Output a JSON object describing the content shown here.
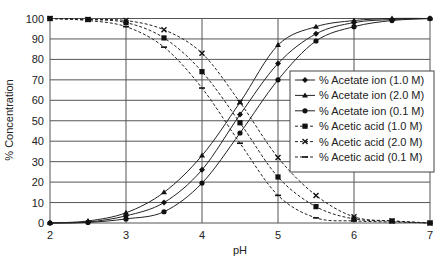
{
  "chart_data": {
    "type": "line",
    "title": "",
    "xlabel": "pH",
    "ylabel": "% Concentration",
    "xlim": [
      2,
      7
    ],
    "ylim": [
      0,
      100
    ],
    "x_ticks": [
      "2",
      "3",
      "4",
      "5",
      "6",
      "7"
    ],
    "y_ticks": [
      "0",
      "10",
      "20",
      "30",
      "40",
      "50",
      "60",
      "70",
      "80",
      "90",
      "100"
    ],
    "grid": true,
    "legend_position": "inside-right",
    "x": [
      2,
      2.5,
      3,
      3.5,
      4,
      4.5,
      5,
      5.5,
      6,
      6.5,
      7
    ],
    "series": [
      {
        "name": "% Acetate ion (1.0 M)",
        "marker": "diamond",
        "dash": "solid",
        "values": [
          0,
          0.5,
          3.5,
          10,
          26,
          53,
          78,
          92.5,
          98,
          99.5,
          100
        ]
      },
      {
        "name": "% Acetate ion (2.0 M)",
        "marker": "triangle",
        "dash": "solid",
        "values": [
          0,
          1,
          5,
          15,
          33,
          59,
          87,
          96,
          99,
          100,
          100
        ]
      },
      {
        "name": "% Acetate ion (0.1 M)",
        "marker": "circle",
        "dash": "solid",
        "values": [
          0,
          0.3,
          2,
          5.5,
          19.5,
          44,
          70,
          89,
          96,
          99,
          100
        ]
      },
      {
        "name": "% Acetic acid (1.0 M)",
        "marker": "square",
        "dash": "dashed",
        "values": [
          100,
          99.5,
          98,
          90.5,
          74,
          49,
          22.5,
          8,
          2,
          1,
          0
        ]
      },
      {
        "name": "% Acetic acid (2.0 M)",
        "marker": "x",
        "dash": "dashed",
        "values": [
          100,
          99.5,
          99,
          94.5,
          83,
          59,
          32,
          13.5,
          3,
          1,
          0
        ]
      },
      {
        "name": "% Acetic acid (0.1 M)",
        "marker": "dash",
        "dash": "dashed",
        "values": [
          100,
          99,
          96,
          86,
          66,
          39,
          13.5,
          2.5,
          1,
          0.5,
          0
        ]
      }
    ]
  }
}
